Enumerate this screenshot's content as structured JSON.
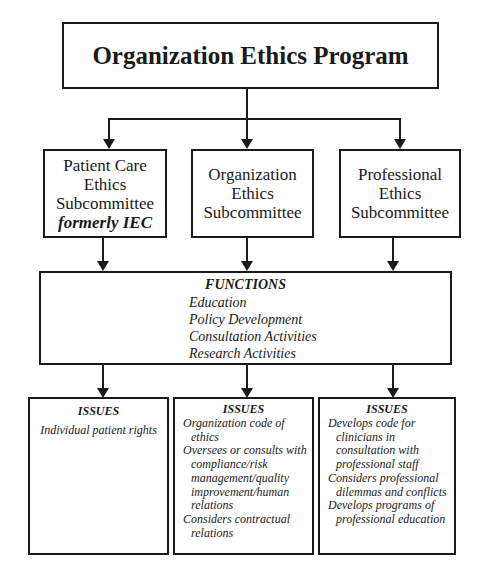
{
  "program": {
    "title": "Organization Ethics Program"
  },
  "subcommittees": [
    {
      "lines": [
        "Patient Care",
        "Ethics",
        "Subcommittee"
      ],
      "note": "formerly IEC"
    },
    {
      "lines": [
        "Organization",
        "Ethics",
        "Subcommittee"
      ],
      "note": ""
    },
    {
      "lines": [
        "Professional",
        "Ethics",
        "Subcommittee"
      ],
      "note": ""
    }
  ],
  "functions": {
    "heading": "FUNCTIONS",
    "items": [
      "Education",
      "Policy Development",
      "Consultation Activities",
      "Research Activities"
    ]
  },
  "issues": [
    {
      "heading": "ISSUES",
      "items": [
        "Individual patient rights"
      ]
    },
    {
      "heading": "ISSUES",
      "items": [
        "Organization code of ethics",
        "Oversees or consults with compliance/risk management/quality improvement/human relations",
        "Considers contractual relations"
      ]
    },
    {
      "heading": "ISSUES",
      "items": [
        "Develops code for clinicians in consultation with professional staff",
        "Considers professional dilemmas and conflicts",
        "Develops programs of professional education"
      ]
    }
  ],
  "colors": {
    "line": "#1a1a1a",
    "background": "#ffffff"
  }
}
